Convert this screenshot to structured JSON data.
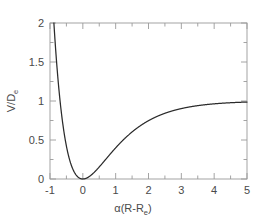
{
  "figure": {
    "background_color": "#ffffff",
    "curve_color": "#2b2b2b",
    "axis_color": "#9a9a9a",
    "text_color": "#4a4a4a"
  },
  "labels": {
    "xaxis_main": "α(R-R",
    "xaxis_sub": "e",
    "xaxis_close": ")",
    "yaxis_main": "V/D",
    "yaxis_sub": "e"
  },
  "ticks": {
    "x": [
      "-1",
      "0",
      "1",
      "2",
      "3",
      "4",
      "5"
    ],
    "y": [
      "0",
      "0.5",
      "1",
      "1.5",
      "2"
    ]
  },
  "chart_data": {
    "type": "line",
    "title": "",
    "xlabel": "α(R-Re)",
    "ylabel": "V/De",
    "xlim": [
      -1,
      5
    ],
    "ylim": [
      0,
      2
    ],
    "grid": false,
    "legend": null,
    "xticks": [
      -1,
      0,
      1,
      2,
      3,
      4,
      5
    ],
    "yticks": [
      0,
      0.5,
      1,
      1.5,
      2
    ],
    "xminor_step": 0.5,
    "yminor_step": 0.25,
    "series": [
      {
        "name": "Morse potential",
        "formula": "V/De = (1 - exp(-x))^2",
        "x": [
          -1.0,
          -0.95,
          -0.9,
          -0.85,
          -0.8,
          -0.75,
          -0.7,
          -0.65,
          -0.6,
          -0.55,
          -0.5,
          -0.45,
          -0.4,
          -0.35,
          -0.3,
          -0.25,
          -0.2,
          -0.15,
          -0.1,
          -0.05,
          0.0,
          0.1,
          0.2,
          0.3,
          0.4,
          0.5,
          0.6,
          0.7,
          0.8,
          0.9,
          1.0,
          1.2,
          1.4,
          1.6,
          1.8,
          2.0,
          2.2,
          2.4,
          2.6,
          2.8,
          3.0,
          3.25,
          3.5,
          3.75,
          4.0,
          4.25,
          4.5,
          4.75,
          5.0
        ],
        "y": [
          2.952,
          2.716,
          2.496,
          2.291,
          2.099,
          1.921,
          1.755,
          1.601,
          1.458,
          1.325,
          1.202,
          1.088,
          0.983,
          0.886,
          0.796,
          0.714,
          0.638,
          0.568,
          0.504,
          0.446,
          0.0,
          0.0091,
          0.0329,
          0.0671,
          0.1087,
          0.1548,
          0.2031,
          0.2516,
          0.299,
          0.3443,
          0.3996,
          0.4892,
          0.5645,
          0.6268,
          0.678,
          0.7476,
          0.7878,
          0.82,
          0.8632,
          0.8878,
          0.9093,
          0.9249,
          0.9396,
          0.9526,
          0.9637,
          0.9719,
          0.978,
          0.9829,
          0.9867
        ],
        "note": "Curve enters frame at top (y=2) near x=-0.79, minimum 0 at x=0, asymptote 1"
      }
    ]
  }
}
